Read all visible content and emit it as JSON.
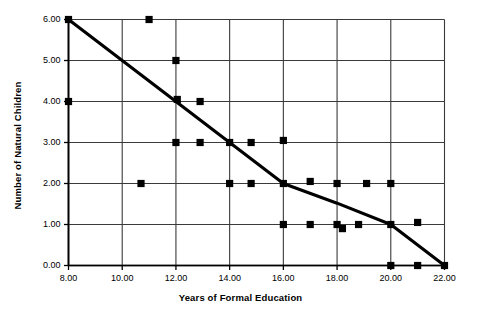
{
  "chart_data": {
    "type": "scatter",
    "title": "",
    "xlabel": "Years of Formal Education",
    "ylabel": "Number of Natural Children",
    "xlim": [
      8,
      22
    ],
    "ylim": [
      0,
      6
    ],
    "xticks": [
      "8.00",
      "10.00",
      "12.00",
      "14.00",
      "16.00",
      "18.00",
      "20.00",
      "22.00"
    ],
    "xtick_values": [
      8,
      10,
      12,
      14,
      16,
      18,
      20,
      22
    ],
    "yticks": [
      "0.00",
      "1.00",
      "2.00",
      "3.00",
      "4.00",
      "5.00",
      "6.00"
    ],
    "ytick_values": [
      0,
      1,
      2,
      3,
      4,
      5,
      6
    ],
    "grid": true,
    "legend": false,
    "series": [
      {
        "name": "observations",
        "marker": "square",
        "color": "#000000",
        "points": [
          [
            8.0,
            6.0
          ],
          [
            8.0,
            4.0
          ],
          [
            11.0,
            6.0
          ],
          [
            10.7,
            2.0
          ],
          [
            12.0,
            5.0
          ],
          [
            12.05,
            4.05
          ],
          [
            12.9,
            4.0
          ],
          [
            12.0,
            3.0
          ],
          [
            12.9,
            3.0
          ],
          [
            14.0,
            3.0
          ],
          [
            14.8,
            3.0
          ],
          [
            16.0,
            3.05
          ],
          [
            14.0,
            2.0
          ],
          [
            14.8,
            2.0
          ],
          [
            16.0,
            2.0
          ],
          [
            17.0,
            2.05
          ],
          [
            18.0,
            2.0
          ],
          [
            19.1,
            2.0
          ],
          [
            20.0,
            2.0
          ],
          [
            16.0,
            1.0
          ],
          [
            17.0,
            1.0
          ],
          [
            18.0,
            1.0
          ],
          [
            18.2,
            0.9
          ],
          [
            18.8,
            1.0
          ],
          [
            20.0,
            1.0
          ],
          [
            21.0,
            1.05
          ],
          [
            20.0,
            0.0
          ],
          [
            21.0,
            0.0
          ],
          [
            22.0,
            0.0
          ]
        ]
      },
      {
        "name": "fit-line",
        "type": "line",
        "color": "#000000",
        "points": [
          [
            8.0,
            6.0
          ],
          [
            10.0,
            5.0
          ],
          [
            12.0,
            4.0
          ],
          [
            14.0,
            3.0
          ],
          [
            16.0,
            2.0
          ],
          [
            18.0,
            1.52
          ],
          [
            20.0,
            1.0
          ],
          [
            22.0,
            0.0
          ]
        ]
      }
    ]
  }
}
